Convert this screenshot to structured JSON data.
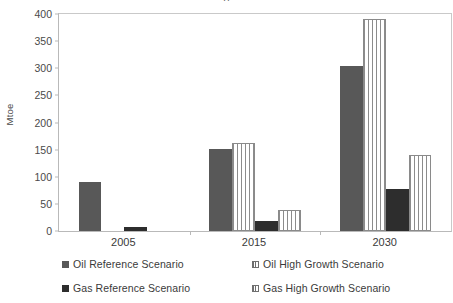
{
  "chart_data": {
    "type": "bar",
    "title": "",
    "xlabel": "",
    "ylabel": "Mtoe",
    "categories": [
      "2005",
      "2015",
      "2030"
    ],
    "ylim": [
      0,
      400
    ],
    "yticks": [
      0,
      50,
      100,
      150,
      200,
      250,
      300,
      350,
      400
    ],
    "grid": false,
    "legend_position": "bottom",
    "series": [
      {
        "name": "Oil Reference Scenario",
        "style": "solid-oil",
        "color": "#585858",
        "values": [
          90,
          152,
          305
        ]
      },
      {
        "name": "Oil High Growth Scenario",
        "style": "striped",
        "color": "#8c8c8c",
        "values": [
          null,
          163,
          390
        ]
      },
      {
        "name": "Gas Reference Scenario",
        "style": "solid-gas",
        "color": "#2d2d2d",
        "values": [
          8,
          18,
          77
        ]
      },
      {
        "name": "Gas High Growth Scenario",
        "style": "striped",
        "color": "#8c8c8c",
        "values": [
          null,
          39,
          141
        ]
      }
    ]
  },
  "legend": {
    "items": [
      {
        "label": "Oil Reference Scenario",
        "style": "solid-oil"
      },
      {
        "label": "Gas Reference Scenario",
        "style": "solid-gas"
      },
      {
        "label": "Oil High Growth Scenario",
        "style": "striped"
      },
      {
        "label": "Gas High Growth Scenario",
        "style": "striped"
      }
    ]
  },
  "axes": {
    "y_label": "Mtoe",
    "y_tick_labels": [
      "400",
      "350",
      "300",
      "250",
      "200",
      "150",
      "100",
      "50",
      "0"
    ],
    "x_tick_labels": [
      "2005",
      "2015",
      "2030"
    ]
  },
  "title_fragment": "g"
}
